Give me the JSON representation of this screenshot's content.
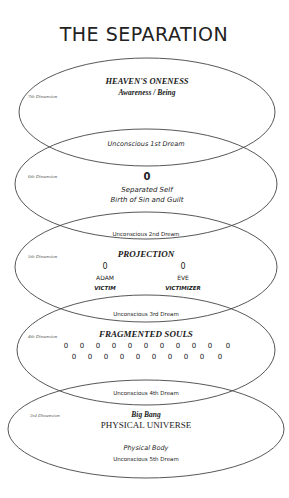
{
  "title": "THE SEPARATION",
  "colors": {
    "background": "#ffffff",
    "stroke": "#444444",
    "text": "#222222"
  },
  "levels": [
    {
      "dimension": "7th Dimension",
      "heading": "HEAVEN'S ONENESS",
      "subheading": "Awareness / Being",
      "overlap_label": "Unconscious 1st Dream"
    },
    {
      "dimension": "6th Dimension",
      "symbol": "0",
      "line1": "Separated Self",
      "line2": "Birth of Sin and Guilt",
      "overlap_label": "Unconscious 2nd Dream"
    },
    {
      "dimension": "5th Dimension",
      "heading": "PROJECTION",
      "left": {
        "symbol": "0",
        "name": "ADAM",
        "role": "VICTIM"
      },
      "right": {
        "symbol": "0",
        "name": "EVE",
        "role": "VICTIMIZER"
      },
      "overlap_label": "Unconscious 3rd Dream"
    },
    {
      "dimension": "4th Dimension",
      "heading": "FRAGMENTED SOULS",
      "row1": [
        "0",
        "0",
        "0",
        "0",
        "0",
        "0",
        "0",
        "0",
        "0",
        "0",
        "0"
      ],
      "row2": [
        "0",
        "0",
        "0",
        "0",
        "0",
        "0",
        "0",
        "0",
        "0",
        "0"
      ],
      "overlap_label": "Unconscious 4th Dream"
    },
    {
      "dimension": "3rd Dimension",
      "heading": "Big Bang",
      "subheading": "PHYSICAL UNIVERSE",
      "line1": "Physical Body",
      "line2": "Unconscious 5th Dream"
    }
  ]
}
